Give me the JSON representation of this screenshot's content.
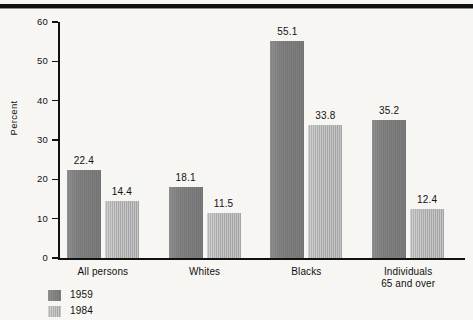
{
  "figure": {
    "background_color": "#f7f6f3",
    "rule_color": "#111111"
  },
  "chart_data": {
    "type": "bar",
    "title": "",
    "subtitle": "",
    "xlabel": "",
    "ylabel": "Percent",
    "ylim": [
      0,
      60
    ],
    "yticks": [
      0,
      10,
      20,
      30,
      40,
      50,
      60
    ],
    "ytick_labels": [
      "0",
      "10",
      "20",
      "30",
      "40",
      "50",
      "60"
    ],
    "grid": false,
    "legend_position": "bottom-left",
    "categories": [
      "All persons",
      "Whites",
      "Blacks",
      "Individuals\n65 and over"
    ],
    "category_labels": [
      {
        "line1": "All persons",
        "line2": ""
      },
      {
        "line1": "Whites",
        "line2": ""
      },
      {
        "line1": "Blacks",
        "line2": ""
      },
      {
        "line1": "Individuals",
        "line2": "65 and over"
      }
    ],
    "series": [
      {
        "name": "1959",
        "color": "#7c7c7c",
        "values": [
          22.4,
          18.1,
          55.1,
          35.2
        ],
        "value_labels": [
          "22.4",
          "18.1",
          "55.1",
          "35.2"
        ]
      },
      {
        "name": "1984",
        "color": "#b2b2b2",
        "values": [
          14.4,
          11.5,
          33.8,
          12.4
        ],
        "value_labels": [
          "14.4",
          "11.5",
          "33.8",
          "12.4"
        ]
      }
    ]
  },
  "legend": {
    "items": [
      {
        "label": "1959",
        "color": "#7c7c7c"
      },
      {
        "label": "1984",
        "color": "#b2b2b2"
      }
    ]
  }
}
